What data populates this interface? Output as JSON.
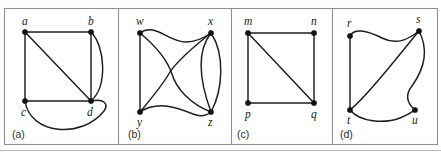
{
  "figure": {
    "background_color": "#ffffff",
    "edge_color": "#1d1d1d",
    "vertex_color": "#121212",
    "frame_color": "#8e8e90",
    "panel_count": 4
  },
  "panels": [
    {
      "id": "a",
      "label": "(a)",
      "vertices": [
        {
          "id": "a",
          "label": "a",
          "x": 25,
          "y": 32,
          "label_x": 22,
          "label_y": 25
        },
        {
          "id": "b",
          "label": "b",
          "x": 91,
          "y": 32,
          "label_x": 88,
          "label_y": 25
        },
        {
          "id": "c",
          "label": "c",
          "x": 25,
          "y": 101,
          "label_x": 21,
          "label_y": 116
        },
        {
          "id": "d",
          "label": "d",
          "x": 91,
          "y": 101,
          "label_x": 87,
          "label_y": 116
        }
      ],
      "edges": [
        {
          "from": "a",
          "to": "b",
          "kind": "straight",
          "d": "M 25 32 L 91 32"
        },
        {
          "from": "a",
          "to": "c",
          "kind": "straight",
          "d": "M 25 32 L 25 101"
        },
        {
          "from": "a",
          "to": "d",
          "kind": "straight",
          "d": "M 25 32 L 91 101"
        },
        {
          "from": "b",
          "to": "d",
          "kind": "straight",
          "d": "M 91 32 L 91 101"
        },
        {
          "from": "c",
          "to": "d",
          "kind": "straight",
          "d": "M 25 101 L 91 101"
        },
        {
          "from": "b",
          "to": "d",
          "kind": "curved",
          "d": "M 91 32 C 105 46 108 86 91 101"
        },
        {
          "from": "c",
          "to": "d",
          "kind": "curved",
          "d": "M 25 101 C 30 135 82 139 104 111 C 109 104 104 98 91 101"
        }
      ],
      "label_x": 12,
      "label_y": 138
    },
    {
      "id": "b",
      "label": "(b)",
      "vertices": [
        {
          "id": "w",
          "label": "w",
          "x": 140,
          "y": 33,
          "label_x": 136,
          "label_y": 25
        },
        {
          "id": "x",
          "label": "x",
          "x": 211,
          "y": 33,
          "label_x": 208,
          "label_y": 25
        },
        {
          "id": "y",
          "label": "y",
          "x": 140,
          "y": 112,
          "label_x": 137,
          "label_y": 126
        },
        {
          "id": "z",
          "label": "z",
          "x": 211,
          "y": 112,
          "label_x": 208,
          "label_y": 126
        }
      ],
      "edges": [
        {
          "from": "w",
          "to": "y",
          "kind": "straight",
          "d": "M 140 33 L 140 112"
        },
        {
          "from": "w",
          "to": "x",
          "kind": "curved",
          "d": "M 140 33 C 155 22 168 42 186 42 C 197 42 204 38 211 33"
        },
        {
          "from": "w",
          "to": "z",
          "kind": "curved",
          "d": "M 140 33 C 158 48 168 62 172 74 C 176 88 190 104 211 112"
        },
        {
          "from": "x",
          "to": "y",
          "kind": "curved",
          "d": "M 211 33 C 192 48 178 60 170 72 C 162 86 150 100 140 112"
        },
        {
          "from": "x",
          "to": "z",
          "kind": "curved",
          "d": "M 211 33 C 196 52 200 82 211 112"
        },
        {
          "from": "x",
          "to": "z",
          "kind": "curved",
          "d": "M 211 33 C 225 54 223 90 211 112"
        },
        {
          "from": "y",
          "to": "z",
          "kind": "curved",
          "d": "M 140 112 C 158 100 178 108 193 114 C 200 117 206 116 211 112"
        }
      ],
      "label_x": 128,
      "label_y": 138
    },
    {
      "id": "c",
      "label": "(c)",
      "vertices": [
        {
          "id": "m",
          "label": "m",
          "x": 248,
          "y": 33,
          "label_x": 244,
          "label_y": 25
        },
        {
          "id": "n",
          "label": "n",
          "x": 314,
          "y": 33,
          "label_x": 311,
          "label_y": 25
        },
        {
          "id": "p",
          "label": "p",
          "x": 248,
          "y": 103,
          "label_x": 245,
          "label_y": 118
        },
        {
          "id": "q",
          "label": "q",
          "x": 314,
          "y": 103,
          "label_x": 311,
          "label_y": 118
        }
      ],
      "edges": [
        {
          "from": "m",
          "to": "n",
          "kind": "straight",
          "d": "M 248 33 L 314 33"
        },
        {
          "from": "m",
          "to": "p",
          "kind": "straight",
          "d": "M 248 33 L 248 103"
        },
        {
          "from": "m",
          "to": "q",
          "kind": "straight",
          "d": "M 248 33 L 314 103"
        },
        {
          "from": "n",
          "to": "q",
          "kind": "straight",
          "d": "M 314 33 L 314 103"
        },
        {
          "from": "p",
          "to": "q",
          "kind": "straight",
          "d": "M 248 103 L 314 103"
        }
      ],
      "label_x": 237,
      "label_y": 138
    },
    {
      "id": "d",
      "label": "(d)",
      "vertices": [
        {
          "id": "r",
          "label": "r",
          "x": 350,
          "y": 36,
          "label_x": 347,
          "label_y": 27
        },
        {
          "id": "s",
          "label": "s",
          "x": 419,
          "y": 31,
          "label_x": 416,
          "label_y": 23
        },
        {
          "id": "t",
          "label": "t",
          "x": 350,
          "y": 110,
          "label_x": 347,
          "label_y": 124
        },
        {
          "id": "u",
          "label": "u",
          "x": 415,
          "y": 110,
          "label_x": 412,
          "label_y": 124
        }
      ],
      "edges": [
        {
          "from": "r",
          "to": "t",
          "kind": "straight",
          "d": "M 350 36 L 350 110"
        },
        {
          "from": "r",
          "to": "s",
          "kind": "curved",
          "d": "M 350 36 C 354 28 366 30 382 38 C 398 46 410 38 419 31"
        },
        {
          "from": "t",
          "to": "s",
          "kind": "curved",
          "d": "M 350 110 C 368 96 398 56 419 31"
        },
        {
          "from": "t",
          "to": "u",
          "kind": "curved",
          "d": "M 350 110 C 360 122 384 124 400 118 C 408 115 412 112 415 110"
        },
        {
          "from": "s",
          "to": "u",
          "kind": "curved",
          "d": "M 419 31 C 430 52 422 72 412 86 C 404 96 408 104 415 110"
        }
      ],
      "label_x": 340,
      "label_y": 138
    }
  ],
  "frame": {
    "x": 4,
    "y": 8,
    "width": 433,
    "height": 136,
    "dividers": [
      118,
      231,
      332
    ]
  }
}
